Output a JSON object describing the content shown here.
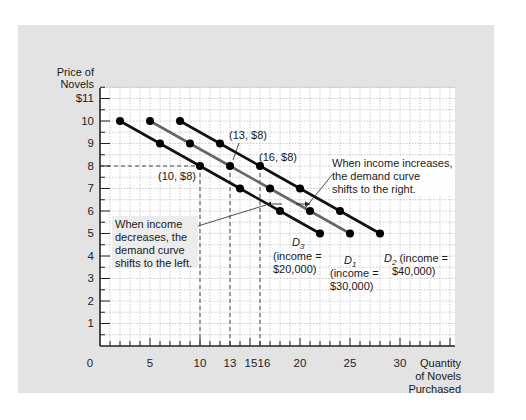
{
  "chart_data": {
    "type": "line",
    "title": "",
    "xlabel": "Quantity of Novels Purchased",
    "ylabel": "Price of Novels",
    "xlim": [
      0,
      36
    ],
    "ylim": [
      0,
      11.5
    ],
    "grid": true,
    "x_ticks": [
      "0",
      "5",
      "10",
      "13",
      "15",
      "16",
      "25",
      "30"
    ],
    "x_tick_values": [
      0,
      5,
      10,
      13,
      15,
      16,
      25,
      30
    ],
    "y_ticks": [
      "1",
      "2",
      "3",
      "4",
      "5",
      "6",
      "7",
      "8",
      "9",
      "10",
      "$11"
    ],
    "y_tick_values": [
      1,
      2,
      3,
      4,
      5,
      6,
      7,
      8,
      9,
      10,
      11
    ],
    "series": [
      {
        "name": "D3",
        "label_main": "D",
        "label_sub": "3",
        "note": "(income = $20,000)",
        "color": "#111111",
        "points": [
          [
            2,
            10
          ],
          [
            6,
            9
          ],
          [
            10,
            8
          ],
          [
            14,
            7
          ],
          [
            18,
            6
          ],
          [
            22,
            5
          ]
        ]
      },
      {
        "name": "D1",
        "label_main": "D",
        "label_sub": "1",
        "note": "(income = $30,000)",
        "color": "#666666",
        "points": [
          [
            5,
            10
          ],
          [
            9,
            9
          ],
          [
            13,
            8
          ],
          [
            17,
            7
          ],
          [
            21,
            6
          ],
          [
            25,
            5
          ]
        ]
      },
      {
        "name": "D2",
        "label_main": "D",
        "label_sub": "2",
        "note": "(income = $40,000)",
        "color": "#111111",
        "points": [
          [
            8,
            10
          ],
          [
            12,
            9
          ],
          [
            16,
            8
          ],
          [
            20,
            7
          ],
          [
            24,
            6
          ],
          [
            28,
            5
          ]
        ]
      }
    ],
    "annotations": [
      {
        "text": "(10, $8)",
        "x": 10,
        "y": 8
      },
      {
        "text": "(13, $8)",
        "x": 13,
        "y": 8
      },
      {
        "text": "(16, $8)",
        "x": 16,
        "y": 8
      },
      {
        "text": "When income increases, the demand curve shifts to the right."
      },
      {
        "text": "When income decreases, the demand curve shifts to the left."
      }
    ]
  },
  "axes": {
    "y_label_line1": "Price of",
    "y_label_line2": "Novels",
    "x_label_line1": "Quantity",
    "x_label_line2": "of Novels",
    "x_label_line3": "Purchased",
    "origin": "0"
  },
  "labels": {
    "pt_10_8": "(10, $8)",
    "pt_13_8": "(13, $8)",
    "pt_16_8": "(16, $8)",
    "increase_1": "When income increases,",
    "increase_2": "the demand curve",
    "increase_3": "shifts to the right.",
    "decrease_1": "When income",
    "decrease_2": "decreases, the",
    "decrease_3": "demand curve",
    "decrease_4": "shifts to the left.",
    "d3_main": "D",
    "d3_sub": "3",
    "d3_inc1": "(income =",
    "d3_inc2": "$20,000)",
    "d1_main": "D",
    "d1_sub": "1",
    "d1_inc1": "(income =",
    "d1_inc2": "$30,000)",
    "d2_main": "D",
    "d2_sub": "2",
    "d2_inc1": "(income =",
    "d2_inc2": "$40,000)"
  },
  "colors": {
    "panel": "#e3e3e3",
    "plot_bg": "#ffffff",
    "grid": "#9a9a9a",
    "dark_curve": "#111111",
    "mid_curve": "#666666"
  }
}
